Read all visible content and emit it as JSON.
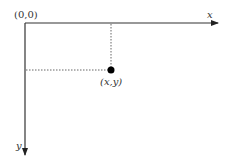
{
  "diagram": {
    "origin_label": "(0,0)",
    "x_axis_label": "x",
    "y_axis_label": "y",
    "point_label": "(x,y)",
    "colors": {
      "axis": "#333333",
      "dotted_guide": "#555555",
      "point": "#000000",
      "background": "#ffffff"
    }
  }
}
